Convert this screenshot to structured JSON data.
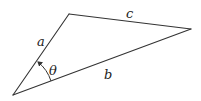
{
  "diagram": {
    "type": "triangle",
    "vertices": {
      "bottom_left": [
        13,
        95
      ],
      "top": [
        69,
        14
      ],
      "right": [
        191,
        29
      ]
    },
    "sides": [
      {
        "name": "a",
        "label": "a",
        "from": "bottom_left",
        "to": "top"
      },
      {
        "name": "b",
        "label": "b",
        "from": "bottom_left",
        "to": "right"
      },
      {
        "name": "c",
        "label": "c",
        "from": "top",
        "to": "right"
      }
    ],
    "angle": {
      "label": "θ",
      "vertex": "bottom_left",
      "between": [
        "b",
        "a"
      ],
      "arrow_direction": "counterclockwise"
    },
    "colors": {
      "stroke": "#333333",
      "text": "#222222",
      "background": "#ffffff"
    }
  }
}
